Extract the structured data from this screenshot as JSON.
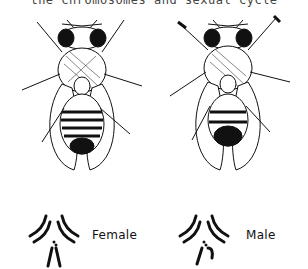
{
  "figure": {
    "top_caption_partial": "the chromosomes and sexual cycle",
    "panels": [
      {
        "id": "female",
        "label": "Female",
        "subject": "fruit fly (Drosophila) dorsal view",
        "chromosomes": "female karyotype diagram (XX)"
      },
      {
        "id": "male",
        "label": "Male",
        "subject": "fruit fly (Drosophila) dorsal view",
        "chromosomes": "male karyotype diagram (XY)"
      }
    ],
    "colors": {
      "ink": "#111111",
      "background": "#ffffff"
    }
  }
}
